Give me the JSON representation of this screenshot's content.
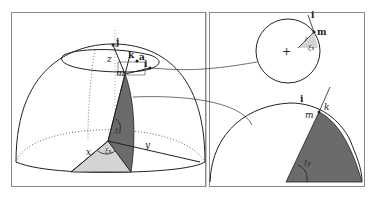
{
  "figure": {
    "left_panel": {
      "description": "Hemisphere with spherical coordinates and local frame",
      "labels": {
        "j": "j",
        "k": "k",
        "a": "a",
        "z": "z",
        "m": "m",
        "i": "i",
        "x": "x",
        "y": "y",
        "xi_z": "ξz",
        "xi_x": "ξx"
      }
    },
    "right_top_panel": {
      "description": "Top view circle with local frame",
      "labels": {
        "i": "i",
        "m": "m",
        "j": "j",
        "xi_x": "ξx",
        "center": "+"
      }
    },
    "right_bottom_panel": {
      "description": "Side section quarter disc",
      "labels": {
        "i": "i",
        "k": "k",
        "m": "m",
        "xi_y": "ξy"
      }
    },
    "colors": {
      "dark_fill": "#6b6b6b",
      "light_fill": "#d4d4d4",
      "line": "#222222",
      "border": "#8a8a8a"
    }
  }
}
